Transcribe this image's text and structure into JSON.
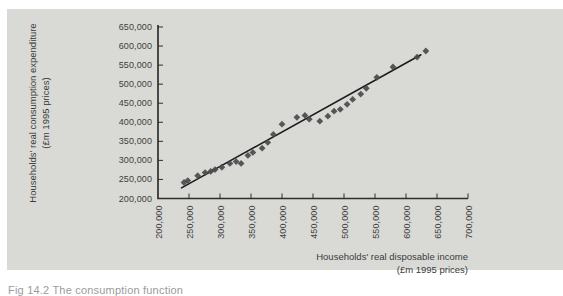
{
  "figure": {
    "caption_fragment": "Fig 14.2 The consumption function"
  },
  "chart_data": {
    "type": "scatter",
    "title": "",
    "xlabel_line1": "Households' real disposable income",
    "xlabel_line2": "(£m 1995 prices)",
    "ylabel_line1": "Households' real consumption expenditure",
    "ylabel_line2": "(£m 1995 prices)",
    "xlim": [
      200000,
      700000
    ],
    "ylim": [
      200000,
      650000
    ],
    "grid": false,
    "legend": "none",
    "xtick_labels": [
      "200,000",
      "250,000",
      "300,000",
      "350,000",
      "400,000",
      "450,000",
      "500,000",
      "550,000",
      "600,000",
      "650,000",
      "700,000"
    ],
    "ytick_labels": [
      "200,000",
      "250,000",
      "300,000",
      "350,000",
      "400,000",
      "450,000",
      "500,000",
      "550,000",
      "600,000",
      "650,000"
    ],
    "points": [
      [
        242000,
        242000
      ],
      [
        248000,
        247000
      ],
      [
        264000,
        260000
      ],
      [
        276000,
        268000
      ],
      [
        285000,
        271000
      ],
      [
        292000,
        276000
      ],
      [
        303000,
        282000
      ],
      [
        316000,
        292000
      ],
      [
        326000,
        297000
      ],
      [
        334000,
        292000
      ],
      [
        345000,
        313000
      ],
      [
        353000,
        321000
      ],
      [
        368000,
        332000
      ],
      [
        377000,
        347000
      ],
      [
        386000,
        368000
      ],
      [
        400000,
        395000
      ],
      [
        424000,
        413000
      ],
      [
        437000,
        418000
      ],
      [
        444000,
        408000
      ],
      [
        461000,
        403000
      ],
      [
        474000,
        416000
      ],
      [
        484000,
        429000
      ],
      [
        494000,
        434000
      ],
      [
        505000,
        447000
      ],
      [
        514000,
        460000
      ],
      [
        527000,
        474000
      ],
      [
        536000,
        489000
      ],
      [
        553000,
        518000
      ],
      [
        579000,
        545000
      ],
      [
        618000,
        571000
      ],
      [
        632000,
        587000
      ]
    ],
    "trendline": {
      "x1": 238000,
      "y1": 228000,
      "x2": 624000,
      "y2": 577000
    },
    "colors": {
      "panel_bg": "#d9dad6",
      "axis": "#2e2e2e",
      "point": "#4b4b4d",
      "trend": "#1c1c1c",
      "text": "#3b3b3b"
    }
  }
}
